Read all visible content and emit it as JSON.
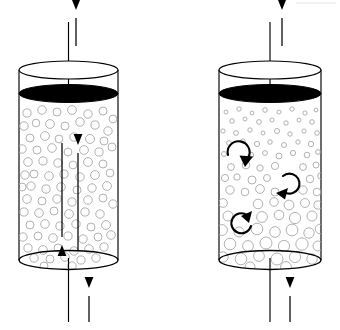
{
  "figure": {
    "background_color": "#ffffff",
    "width": 340,
    "height": 330,
    "line_color": "#000000",
    "bubble_color": "#a8a8a8",
    "surface_color": "#000000"
  },
  "panels": [
    {
      "id": "left",
      "name": "homogeneous-bubble-column",
      "label": "",
      "vessel": {
        "left": 19,
        "right": 118,
        "center_x": 68.5,
        "rim_center_y": 70,
        "rim_rx": 49.5,
        "rim_ry": 9,
        "surface_center_y": 93.5,
        "surface_rx": 49.5,
        "surface_ry": 9,
        "base_center_y": 260,
        "base_rx": 49.5,
        "base_ry": 9.5
      },
      "outlet_pipe": {
        "x": 68.5,
        "y_top": 22,
        "y_bottom": 95
      },
      "outlet_arrow": {
        "x": 76,
        "y_tail": 46,
        "y_head": 10,
        "direction": "up"
      },
      "inlet_pipe": {
        "x": 68.5,
        "y_top": 258,
        "y_bottom": 322
      },
      "inlet_arrow": {
        "x": 89,
        "y_tail": 322,
        "y_head": 288,
        "direction": "up"
      },
      "internal_arrows": [
        {
          "name": "downflow-arrow",
          "x": 62,
          "y_tail": 143,
          "y_head": 245,
          "direction": "down"
        },
        {
          "name": "upflow-arrow",
          "x": 78,
          "y_tail": 250,
          "y_head": 145,
          "direction": "up"
        }
      ],
      "bubbles": {
        "style": "uniform",
        "radius_min": 3.6,
        "radius_max": 4.6,
        "count": 86
      }
    },
    {
      "id": "right",
      "name": "heterogeneous-bubble-column",
      "label": "",
      "vessel": {
        "left": 219,
        "right": 321,
        "center_x": 270,
        "rim_center_y": 70,
        "rim_rx": 51,
        "rim_ry": 9,
        "surface_center_y": 93.5,
        "surface_rx": 51,
        "surface_ry": 9,
        "base_center_y": 260,
        "base_rx": 51,
        "base_ry": 9.5
      },
      "outlet_pipe": {
        "x": 270,
        "y_top": 22,
        "y_bottom": 95
      },
      "outlet_arrow": {
        "x": 282,
        "y_tail": 46,
        "y_head": 10,
        "direction": "up"
      },
      "inlet_pipe": {
        "x": 270,
        "y_top": 258,
        "y_bottom": 322
      },
      "inlet_arrow": {
        "x": 290,
        "y_tail": 322,
        "y_head": 288,
        "direction": "up"
      },
      "circulation_arrows": [
        {
          "name": "circulation-arrow-upper",
          "cx": 238,
          "cy": 152,
          "r": 11,
          "rotation": 0,
          "sweep": "clockwise"
        },
        {
          "name": "circulation-arrow-middle",
          "cx": 288,
          "cy": 184,
          "r": 10,
          "rotation": 35,
          "sweep": "clockwise"
        },
        {
          "name": "circulation-arrow-lower",
          "cx": 243,
          "cy": 222,
          "r": 10,
          "rotation": 150,
          "sweep": "clockwise"
        }
      ],
      "bubbles": {
        "style": "graded-small-top-large-bottom",
        "radius_top": 2.1,
        "radius_bottom": 6.2,
        "count": 96
      }
    }
  ],
  "artifacts": [
    {
      "name": "scan-edge-mark",
      "x": 296,
      "y": 2,
      "width": 40,
      "height": 2,
      "opacity": 0.35
    }
  ]
}
